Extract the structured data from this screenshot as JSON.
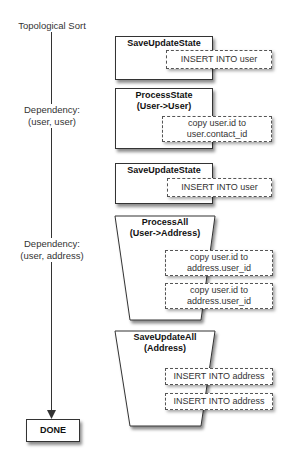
{
  "timeline": {
    "start_label": "Topological Sort",
    "dependencies": [
      {
        "line1": "Dependency:",
        "line2": "(user, user)"
      },
      {
        "line1": "Dependency:",
        "line2": "(user, address)"
      }
    ],
    "end_label": "DONE"
  },
  "steps": [
    {
      "title": "SaveUpdateState",
      "subtitle": "",
      "shape": "rect",
      "actions": [
        {
          "line1": "INSERT INTO user",
          "line2": ""
        }
      ]
    },
    {
      "title": "ProcessState",
      "subtitle": "(User->User)",
      "shape": "rect",
      "actions": [
        {
          "line1": "copy user.id to",
          "line2": "user.contact_id"
        }
      ]
    },
    {
      "title": "SaveUpdateState",
      "subtitle": "",
      "shape": "rect",
      "actions": [
        {
          "line1": "INSERT INTO user",
          "line2": ""
        }
      ]
    },
    {
      "title": "ProcessAll",
      "subtitle": "(User->Address)",
      "shape": "trapezoid",
      "actions": [
        {
          "line1": "copy user.id to",
          "line2": "address.user_id"
        },
        {
          "line1": "copy user.id to",
          "line2": "address.user_id"
        }
      ]
    },
    {
      "title": "SaveUpdateAll",
      "subtitle": "(Address)",
      "shape": "trapezoid",
      "actions": [
        {
          "line1": "INSERT INTO address",
          "line2": ""
        },
        {
          "line1": "INSERT INTO address",
          "line2": ""
        }
      ]
    }
  ],
  "colors": {
    "stroke": "#333333",
    "background": "#ffffff",
    "text": "#222222"
  }
}
